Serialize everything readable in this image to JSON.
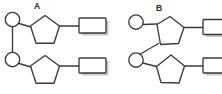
{
  "figure": {
    "type": "diagram",
    "background_color": "#ffffff",
    "stroke_color": "#3b3b3b",
    "shadow_color": "#c9c9c9"
  },
  "panels": [
    {
      "id": "panel-a",
      "label": "A",
      "label_x": 34,
      "label_y": 9,
      "description": "Two nucleotide units with upright pentagonal sugar rings linked by a vertical phosphodiester backbone",
      "nucleotides": [
        {
          "id": "nucleotide-a1",
          "phosphate": {
            "cx": 12.5,
            "cy": 19.5,
            "r": 7.2,
            "icon": "circle-phosphate-icon"
          },
          "sugar": {
            "cx": 45,
            "cy": 30,
            "r": 15,
            "rotation": 0,
            "icon": "pentagon-sugar-icon"
          },
          "base": {
            "x": 79,
            "y": 18,
            "width": 27,
            "height": 15,
            "icon": "rect-base-icon"
          },
          "phosphate_to_sugar_bond": {
            "x1": 19,
            "y1": 23,
            "x2": 32,
            "y2": 27
          },
          "sugar_to_base_bond": {
            "x1": 60,
            "y1": 26,
            "x2": 79,
            "y2": 26
          }
        },
        {
          "id": "nucleotide-a2",
          "phosphate": {
            "cx": 12.5,
            "cy": 59.5,
            "r": 7.2,
            "icon": "circle-phosphate-icon"
          },
          "sugar": {
            "cx": 45,
            "cy": 70,
            "r": 15,
            "rotation": 0,
            "icon": "pentagon-sugar-icon"
          },
          "base": {
            "x": 79,
            "y": 58,
            "width": 27,
            "height": 15,
            "icon": "rect-base-icon"
          },
          "phosphate_to_sugar_bond": {
            "x1": 19,
            "y1": 63,
            "x2": 32,
            "y2": 67
          },
          "sugar_to_base_bond": {
            "x1": 60,
            "y1": 66,
            "x2": 79,
            "y2": 66
          }
        }
      ],
      "backbone_link": {
        "x1": 12.5,
        "y1": 26.7,
        "x2": 12.5,
        "y2": 52.3,
        "orientation": "vertical"
      }
    },
    {
      "id": "panel-b",
      "label": "B",
      "label_x": 156,
      "label_y": 11,
      "description": "Two nucleotide units with tilted pentagonal sugar rings linked by a diagonal phosphodiester backbone; bases extend past the right edge",
      "nucleotides": [
        {
          "id": "nucleotide-b1",
          "phosphate": {
            "cx": 136,
            "cy": 22,
            "r": 7.2,
            "icon": "circle-phosphate-icon"
          },
          "sugar": {
            "cx": 170,
            "cy": 31,
            "r": 15,
            "rotation": -28,
            "icon": "pentagon-sugar-icon"
          },
          "base": {
            "x": 203,
            "y": 19,
            "width": 27,
            "height": 15,
            "icon": "rect-base-icon"
          },
          "phosphate_to_sugar_bond": {
            "x1": 142.5,
            "y1": 25,
            "x2": 157,
            "y2": 25
          },
          "sugar_to_base_bond": {
            "x1": 184,
            "y1": 27,
            "x2": 203,
            "y2": 27
          }
        },
        {
          "id": "nucleotide-b2",
          "phosphate": {
            "cx": 136,
            "cy": 60,
            "r": 7.2,
            "icon": "circle-phosphate-icon"
          },
          "sugar": {
            "cx": 170,
            "cy": 70,
            "r": 15,
            "rotation": -10,
            "icon": "pentagon-sugar-icon"
          },
          "base": {
            "x": 203,
            "y": 58,
            "width": 27,
            "height": 15,
            "icon": "rect-base-icon"
          },
          "phosphate_to_sugar_bond": {
            "x1": 142.5,
            "y1": 63,
            "x2": 156,
            "y2": 66
          },
          "sugar_to_base_bond": {
            "x1": 184,
            "y1": 66,
            "x2": 203,
            "y2": 66
          }
        }
      ],
      "backbone_link": {
        "x1": 158,
        "y1": 44,
        "x2": 139,
        "y2": 54,
        "orientation": "diagonal"
      }
    }
  ]
}
